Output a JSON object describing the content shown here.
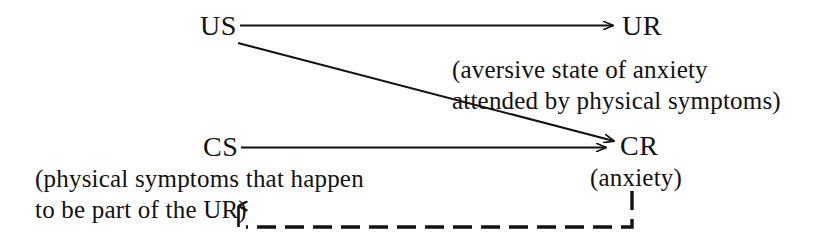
{
  "diagram": {
    "background_color": "#ffffff",
    "ink_color": "#111111",
    "nodes": [
      {
        "id": "us",
        "label": "US",
        "x": 200,
        "y": 12
      },
      {
        "id": "ur",
        "label": "UR",
        "x": 622,
        "y": 12
      },
      {
        "id": "cs",
        "label": "CS",
        "x": 203,
        "y": 133
      },
      {
        "id": "cr",
        "label": "CR",
        "x": 620,
        "y": 132
      }
    ],
    "annotations": [
      {
        "id": "ur-note-line1",
        "text": "(aversive state of anxiety",
        "x": 452,
        "y": 57
      },
      {
        "id": "ur-note-line2",
        "text": "attended by physical symptoms)",
        "x": 452,
        "y": 88
      },
      {
        "id": "cs-note-line1",
        "text": "(physical symptoms that happen",
        "x": 35,
        "y": 166
      },
      {
        "id": "cs-note-line2",
        "text": "to be part of the UR)",
        "x": 35,
        "y": 197
      },
      {
        "id": "cr-note",
        "text": "(anxiety)",
        "x": 590,
        "y": 165
      }
    ],
    "connectors": [
      {
        "id": "us-to-ur",
        "from": "US",
        "to": "UR",
        "style": "solid",
        "direction": "horizontal"
      },
      {
        "id": "us-to-cr",
        "from": "US",
        "to": "CR",
        "style": "solid",
        "direction": "diagonal"
      },
      {
        "id": "cs-to-cr",
        "from": "CS",
        "to": "CR",
        "style": "solid",
        "direction": "horizontal"
      },
      {
        "id": "cr-feedback-to-ur-note",
        "from": "CR",
        "to": "UR (in CS note)",
        "style": "dashed",
        "direction": "down-left-up"
      }
    ]
  }
}
